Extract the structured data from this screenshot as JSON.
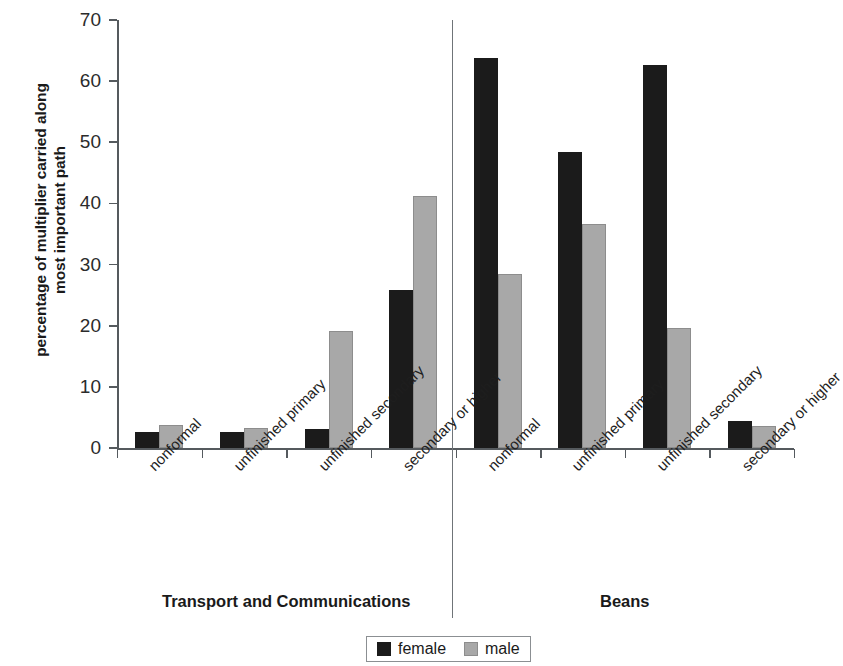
{
  "chart_data": {
    "type": "bar",
    "title": "",
    "subtitle": "",
    "xlabel": "",
    "ylabel": "percentage of multiplier carried along most important path",
    "ylabel_lines": [
      "percentage of multiplier carried along",
      "most important path"
    ],
    "ylim": [
      0,
      70
    ],
    "ytick_values": [
      0,
      10,
      20,
      30,
      40,
      50,
      60,
      70
    ],
    "ytick_labels": [
      "0",
      "10",
      "20",
      "30",
      "40",
      "50",
      "60",
      "70"
    ],
    "grid": false,
    "legend_position": "bottom-center",
    "categories": [
      "nonformal",
      "unfinished primary",
      "unfinished secondary",
      "secondary or higher"
    ],
    "groups": [
      {
        "name": "Transport and Communications",
        "categories": [
          "nonformal",
          "unfinished primary",
          "unfinished secondary",
          "secondary or higher"
        ],
        "series": [
          {
            "name": "female",
            "color": "#1b1b1b",
            "values": [
              2.6,
              2.6,
              3.1,
              25.8
            ]
          },
          {
            "name": "male",
            "color": "#a8a8a8",
            "values": [
              3.7,
              3.3,
              19.1,
              41.2
            ]
          }
        ]
      },
      {
        "name": "Beans",
        "categories": [
          "nonformal",
          "unfinished primary",
          "unfinished secondary",
          "secondary or higher"
        ],
        "series": [
          {
            "name": "female",
            "color": "#1b1b1b",
            "values": [
              63.8,
              48.4,
              62.7,
              4.5
            ]
          },
          {
            "name": "male",
            "color": "#a8a8a8",
            "values": [
              28.5,
              36.7,
              19.6,
              3.6
            ]
          }
        ]
      }
    ],
    "series_names": [
      "female",
      "male"
    ],
    "legend": [
      {
        "label": "female",
        "color": "#1b1b1b"
      },
      {
        "label": "male",
        "color": "#a8a8a8"
      }
    ],
    "axis_color": "#555a5e",
    "divider_color": "#6f7478"
  }
}
